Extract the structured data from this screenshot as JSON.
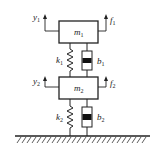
{
  "diagram": {
    "masses": [
      {
        "id": "m1",
        "label": "m",
        "sub": "1"
      },
      {
        "id": "m2",
        "label": "m",
        "sub": "2"
      }
    ],
    "springs": [
      {
        "id": "k1",
        "label": "k",
        "sub": "1"
      },
      {
        "id": "k2",
        "label": "k",
        "sub": "2"
      }
    ],
    "dampers": [
      {
        "id": "b1",
        "label": "b",
        "sub": "1"
      },
      {
        "id": "b2",
        "label": "b",
        "sub": "2"
      }
    ],
    "displacements": [
      {
        "id": "y1",
        "label": "y",
        "sub": "1"
      },
      {
        "id": "y2",
        "label": "y",
        "sub": "2"
      }
    ],
    "forces": [
      {
        "id": "f1",
        "label": "f",
        "sub": "1"
      },
      {
        "id": "f2",
        "label": "f",
        "sub": "2"
      }
    ],
    "ground": "fixed-ground-hatched",
    "colors": {
      "stroke": "#222222",
      "background": "#ffffff"
    }
  }
}
